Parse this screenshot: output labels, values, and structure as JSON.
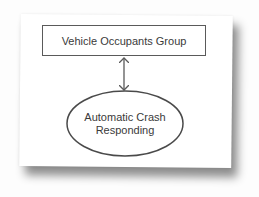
{
  "diagram": {
    "type": "flow",
    "nodes": [
      {
        "id": "vehicle-occupants-group",
        "shape": "rectangle",
        "label": "Vehicle Occupants Group"
      },
      {
        "id": "automatic-crash-responding",
        "shape": "ellipse",
        "label_lines": [
          "Automatic Crash",
          "Responding"
        ]
      }
    ],
    "edges": [
      {
        "from": "vehicle-occupants-group",
        "to": "automatic-crash-responding",
        "direction": "bidirectional"
      }
    ],
    "colors": {
      "stroke": "#5a5a5a",
      "text": "#3a3a3a",
      "paper": "#ffffff"
    }
  }
}
